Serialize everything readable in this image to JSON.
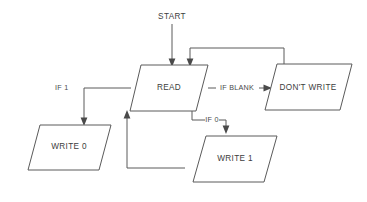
{
  "diagram": {
    "type": "flowchart",
    "background_color": "#ffffff",
    "line_color": "#5a5a5a",
    "text_color": "#3d3d3d",
    "entry_label": "START",
    "nodes": [
      {
        "id": "read",
        "label": "READ",
        "shape": "parallelogram"
      },
      {
        "id": "dont_write",
        "label": "DON'T WRITE",
        "shape": "parallelogram"
      },
      {
        "id": "write_0",
        "label": "WRITE 0",
        "shape": "parallelogram"
      },
      {
        "id": "write_1",
        "label": "WRITE 1",
        "shape": "parallelogram"
      }
    ],
    "edges": [
      {
        "id": "start_to_read",
        "label": "",
        "from": "START",
        "to": "read"
      },
      {
        "id": "read_to_write_0",
        "label": "IF 1",
        "from": "read",
        "to": "write_0"
      },
      {
        "id": "read_to_dont_write",
        "label": "IF BLANK",
        "from": "read",
        "to": "dont_write"
      },
      {
        "id": "read_to_write_1",
        "label": "IF 0",
        "from": "read",
        "to": "write_1"
      },
      {
        "id": "dont_write_to_read",
        "label": "",
        "from": "dont_write",
        "to": "read"
      },
      {
        "id": "write_1_to_read",
        "label": "",
        "from": "write_1",
        "to": "read"
      }
    ]
  }
}
